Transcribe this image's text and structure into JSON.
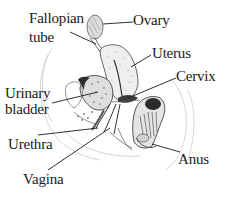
{
  "diagram": {
    "labels": {
      "fallopian_tube_line1": "Fallopian",
      "fallopian_tube_line2": "tube",
      "ovary": "Ovary",
      "uterus": "Uterus",
      "cervix": "Cervix",
      "urinary_bladder_line1": "Urinary",
      "urinary_bladder_line2": "bladder",
      "urethra": "Urethra",
      "anus": "Anus",
      "vagina": "Vagina"
    },
    "colors": {
      "ink": "#1a1a1a",
      "outline": "#555555",
      "faint": "#b8b8b8",
      "shade": "#7a7a7a",
      "dark": "#2e2e2e",
      "fill": "#ececec"
    }
  }
}
